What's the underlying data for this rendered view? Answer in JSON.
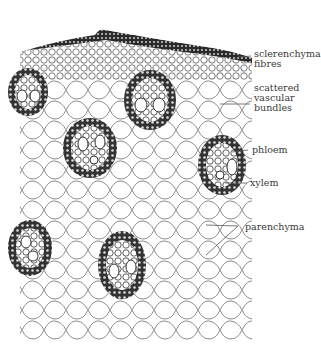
{
  "figure": {
    "colors": {
      "cell_wall": "#555555",
      "cell_fill": "#ffffff",
      "bundle_dark": "#2f2f2f",
      "bundle_sheath": "#444444",
      "label_text": "#3a3a3a",
      "leader_line": "#555555"
    },
    "labels": [
      {
        "id": "sclerenchyma",
        "lines": [
          "sclerenchyma",
          "fibres"
        ]
      },
      {
        "id": "vascular-bundles",
        "lines": [
          "scattered",
          "vascular",
          "bundles"
        ]
      },
      {
        "id": "phloem",
        "lines": [
          "phloem"
        ]
      },
      {
        "id": "xylem",
        "lines": [
          "xylem"
        ]
      },
      {
        "id": "parenchyma",
        "lines": [
          "parenchyma"
        ]
      }
    ]
  }
}
